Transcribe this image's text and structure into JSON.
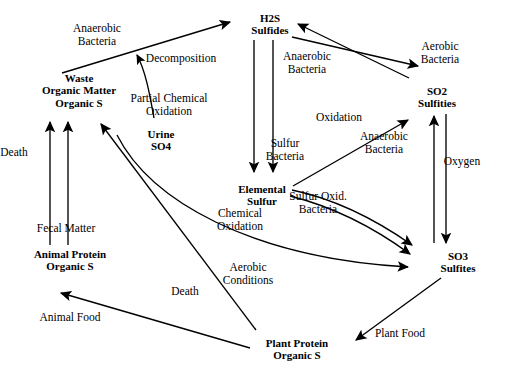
{
  "diagram": {
    "type": "cycle-diagram",
    "background": "#ffffff",
    "stroke": "#000000"
  },
  "nodes": [
    {
      "id": "h2s",
      "lines": [
        "H2S",
        "Sulfides"
      ],
      "x": 270,
      "y": 12,
      "w": 90,
      "bold": true
    },
    {
      "id": "waste",
      "lines": [
        "Waste",
        "Organic Matter",
        "Organic S"
      ],
      "x": 79,
      "y": 72,
      "w": 126,
      "bold": true
    },
    {
      "id": "so2",
      "lines": [
        "SO2",
        "Sulfities"
      ],
      "x": 437,
      "y": 85,
      "w": 86,
      "bold": true
    },
    {
      "id": "urine",
      "lines": [
        "Urine",
        "SO4"
      ],
      "x": 161,
      "y": 128,
      "w": 60,
      "bold": true
    },
    {
      "id": "elemental",
      "lines": [
        "Elemental",
        "Sulfur"
      ],
      "x": 262,
      "y": 183,
      "w": 86,
      "bold": true
    },
    {
      "id": "animal-protein",
      "lines": [
        "Animal Protein",
        "Organic S"
      ],
      "x": 70,
      "y": 248,
      "w": 120,
      "bold": true
    },
    {
      "id": "so3",
      "lines": [
        "SO3",
        "Sulfites"
      ],
      "x": 458,
      "y": 250,
      "w": 70,
      "bold": true
    },
    {
      "id": "plant-protein",
      "lines": [
        "Plant Protein",
        "Organic S"
      ],
      "x": 297,
      "y": 337,
      "w": 114,
      "bold": true
    }
  ],
  "edge_labels": [
    {
      "id": "anaerobic-bacteria-decomp",
      "lines": [
        "Anaerobic",
        "Bacteria"
      ],
      "x": 97,
      "y": 22,
      "w": 78
    },
    {
      "id": "decomposition",
      "lines": [
        "Decomposition"
      ],
      "x": 181,
      "y": 52,
      "w": 92
    },
    {
      "id": "anaerobic-bacteria-h2s",
      "lines": [
        "Anaerobic",
        "Bacteria"
      ],
      "x": 307,
      "y": 50,
      "w": 72
    },
    {
      "id": "aerobic-bacteria-so2",
      "lines": [
        "Aerobic",
        "Bacteria"
      ],
      "x": 440,
      "y": 40,
      "w": 64
    },
    {
      "id": "partial-chemical-oxidation",
      "lines": [
        "Partial Chemical",
        "Oxidation"
      ],
      "x": 169,
      "y": 92,
      "w": 110
    },
    {
      "id": "oxidation",
      "lines": [
        "Oxidation"
      ],
      "x": 339,
      "y": 111,
      "w": 68
    },
    {
      "id": "death-left",
      "lines": [
        "Death"
      ],
      "x": 14,
      "y": 146,
      "w": 46
    },
    {
      "id": "sulfur-bacteria",
      "lines": [
        "Sulfur",
        "Bacteria"
      ],
      "x": 285,
      "y": 137,
      "w": 62
    },
    {
      "id": "anaerobic-bacteria-so3",
      "lines": [
        "Anaerobic",
        "Bacteria"
      ],
      "x": 384,
      "y": 130,
      "w": 70
    },
    {
      "id": "oxygen",
      "lines": [
        "Oxygen"
      ],
      "x": 462,
      "y": 155,
      "w": 54
    },
    {
      "id": "fecal-matter",
      "lines": [
        "Fecal Matter"
      ],
      "x": 66,
      "y": 222,
      "w": 78
    },
    {
      "id": "sulfur-oxid-bacteria",
      "lines": [
        "Sulfur Oxid.",
        "Bacteria"
      ],
      "x": 318,
      "y": 190,
      "w": 78
    },
    {
      "id": "chemical-oxidation",
      "lines": [
        "Chemical",
        "Oxidation"
      ],
      "x": 240,
      "y": 207,
      "w": 70
    },
    {
      "id": "aerobic-conditions",
      "lines": [
        "Aerobic",
        "Conditions"
      ],
      "x": 248,
      "y": 261,
      "w": 72
    },
    {
      "id": "death-center",
      "lines": [
        "Death"
      ],
      "x": 185,
      "y": 285,
      "w": 46
    },
    {
      "id": "animal-food",
      "lines": [
        "Animal Food"
      ],
      "x": 70,
      "y": 311,
      "w": 84
    },
    {
      "id": "plant-food",
      "lines": [
        "Plant Food"
      ],
      "x": 400,
      "y": 327,
      "w": 72
    }
  ],
  "edges": [
    {
      "id": "waste-to-h2s",
      "from": "waste",
      "to": "h2s",
      "label": "Decomposition / Anaerobic Bacteria"
    },
    {
      "id": "urine-to-decomp",
      "from": "urine",
      "to": "waste-h2s-line",
      "label": "Urine SO4"
    },
    {
      "id": "h2s-to-elemental-a",
      "from": "h2s",
      "to": "elemental",
      "label": "Partial Chemical Oxidation"
    },
    {
      "id": "h2s-to-elemental-b",
      "from": "h2s",
      "to": "elemental",
      "label": "Sulfur Bacteria"
    },
    {
      "id": "so2-to-h2s",
      "from": "so2",
      "to": "h2s",
      "label": "Anaerobic Bacteria"
    },
    {
      "id": "h2s-to-so2",
      "from": "h2s",
      "to": "so2",
      "label": "Aerobic Bacteria"
    },
    {
      "id": "elemental-to-so2",
      "from": "elemental",
      "to": "so2",
      "label": "Oxidation"
    },
    {
      "id": "so3-to-so2",
      "from": "so3",
      "to": "so2",
      "label": "Anaerobic Bacteria"
    },
    {
      "id": "so2-to-so3",
      "from": "so2",
      "to": "so3",
      "label": "Oxygen"
    },
    {
      "id": "elemental-to-so3-a",
      "from": "elemental",
      "to": "so3",
      "label": "Sulfur Oxid. Bacteria"
    },
    {
      "id": "elemental-to-so3-b",
      "from": "elemental",
      "to": "so3",
      "label": "Chemical Oxidation"
    },
    {
      "id": "waste-to-so3",
      "from": "waste",
      "to": "so3",
      "label": "Aerobic Conditions"
    },
    {
      "id": "animal-to-waste-death",
      "from": "animal-protein",
      "to": "waste",
      "label": "Death"
    },
    {
      "id": "animal-to-waste-fecal",
      "from": "animal-protein",
      "to": "waste",
      "label": "Fecal Matter"
    },
    {
      "id": "plant-to-waste-death",
      "from": "plant-protein",
      "to": "waste",
      "label": "Death"
    },
    {
      "id": "plant-to-animal",
      "from": "plant-protein",
      "to": "animal-protein",
      "label": "Animal Food"
    },
    {
      "id": "so3-to-plant",
      "from": "so3",
      "to": "plant-protein",
      "label": "Plant Food"
    }
  ]
}
